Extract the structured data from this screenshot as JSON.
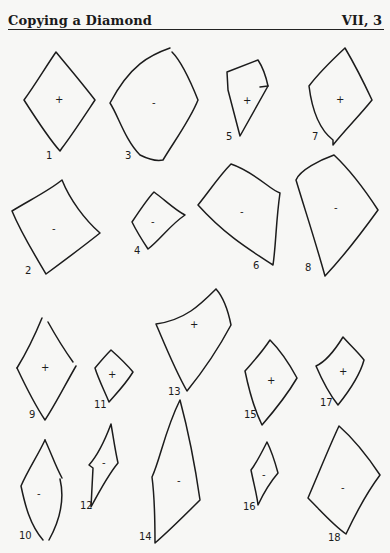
{
  "page": {
    "title": "Copying a Diamond",
    "section": "VII, 3"
  },
  "figures": [
    {
      "id": "1",
      "label": "1",
      "sign": "+"
    },
    {
      "id": "2",
      "label": "2",
      "sign": "-"
    },
    {
      "id": "3",
      "label": "3",
      "sign": "+"
    },
    {
      "id": "4",
      "label": "4",
      "sign": "-"
    },
    {
      "id": "5",
      "label": "5",
      "sign": "+"
    },
    {
      "id": "6",
      "label": "6",
      "sign": "-"
    },
    {
      "id": "7",
      "label": "7",
      "sign": "+"
    },
    {
      "id": "8",
      "label": "8",
      "sign": "-"
    },
    {
      "id": "9",
      "label": "9",
      "sign": "+"
    },
    {
      "id": "10",
      "label": "10",
      "sign": "-"
    },
    {
      "id": "11",
      "label": "11",
      "sign": "+"
    },
    {
      "id": "12",
      "label": "12",
      "sign": "-"
    },
    {
      "id": "13",
      "label": "13",
      "sign": "+"
    },
    {
      "id": "14",
      "label": "14",
      "sign": "-"
    },
    {
      "id": "15",
      "label": "15",
      "sign": "+"
    },
    {
      "id": "16",
      "label": "16",
      "sign": "-"
    },
    {
      "id": "17",
      "label": "17",
      "sign": "+"
    },
    {
      "id": "18",
      "label": "18",
      "sign": "-"
    }
  ]
}
